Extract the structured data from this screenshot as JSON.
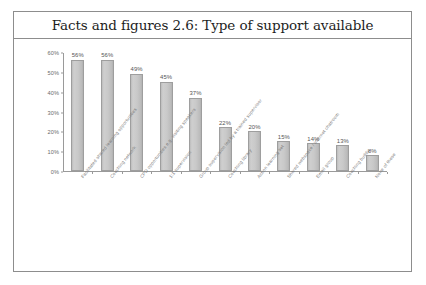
{
  "figure": {
    "title": "Facts and figures 2.6: Type of support available"
  },
  "axis": {
    "y_ticks": [
      "60%",
      "50%",
      "40%",
      "30%",
      "20%",
      "10%",
      "0%"
    ]
  },
  "chart_data": {
    "type": "bar",
    "title": "Facts and figures 2.6: Type of support available",
    "xlabel": "",
    "ylabel": "",
    "ylim": [
      0,
      60
    ],
    "ytick_values": [
      0,
      10,
      20,
      30,
      40,
      50,
      60
    ],
    "ytick_labels": [
      "0%",
      "10%",
      "20%",
      "30%",
      "40%",
      "50%",
      "60%"
    ],
    "grid": false,
    "legend": false,
    "value_label_format": "percent",
    "categories": [
      "Facilitated shared learning opportunities",
      "Coaching network",
      "CPD opportunities e.g. visiting speakers",
      "1:1 supervision",
      "Group supervision led by a trained supervisor",
      "Coaching library",
      "Action learning set",
      "Shared webspace / internet chatroom",
      "Email group",
      "Coaching buddy",
      "None of these"
    ],
    "values": [
      56,
      56,
      49,
      45,
      37,
      22,
      20,
      15,
      14,
      13,
      8
    ],
    "value_labels": [
      "56%",
      "56%",
      "49%",
      "45%",
      "37%",
      "22%",
      "20%",
      "15%",
      "14%",
      "13%",
      "8%"
    ],
    "bar_color": "#c8c8c8",
    "bar_border_color": "#9e9e9e"
  }
}
